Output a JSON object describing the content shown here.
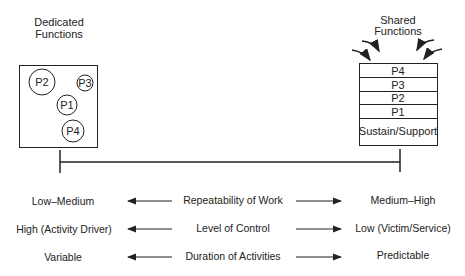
{
  "left": {
    "title_line1": "Dedicated",
    "title_line2": "Functions",
    "processes": [
      "P2",
      "P3",
      "P1",
      "P4"
    ]
  },
  "right": {
    "title_line1": "Shared",
    "title_line2": "Functions",
    "stack": [
      "P4",
      "P3",
      "P2",
      "P1",
      "Sustain/Support"
    ]
  },
  "rows": [
    {
      "left": "Low–Medium",
      "center": "Repeatability of Work",
      "right": "Medium–High"
    },
    {
      "left": "High (Activity Driver)",
      "center": "Level of Control",
      "right": "Low (Victim/Service)"
    },
    {
      "left": "Variable",
      "center": "Duration of Activities",
      "right": "Predictable"
    }
  ]
}
